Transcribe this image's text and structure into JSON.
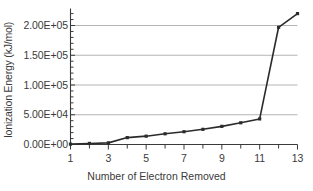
{
  "chart_data": {
    "type": "line",
    "title": "",
    "xlabel": "Number of Electron Removed",
    "ylabel": "Ionization Energy (kJ/mol)",
    "x": [
      1,
      2,
      3,
      4,
      5,
      6,
      7,
      8,
      9,
      10,
      11,
      12,
      13
    ],
    "values": [
      600,
      1800,
      2700,
      11600,
      14000,
      18000,
      21500,
      25500,
      30500,
      36500,
      43000,
      197000,
      220000
    ],
    "series": [
      {
        "name": "Ionization Energy",
        "values": [
          600,
          1800,
          2700,
          11600,
          14000,
          18000,
          21500,
          25500,
          30500,
          36500,
          43000,
          197000,
          220000
        ]
      }
    ],
    "xlim": [
      1,
      13
    ],
    "ylim": [
      0,
      230000
    ],
    "x_tick_labels": [
      "1",
      "3",
      "5",
      "7",
      "9",
      "11",
      "13"
    ],
    "x_tick_values": [
      1,
      3,
      5,
      7,
      9,
      11,
      13
    ],
    "x_minor_tick_values": [
      2,
      4,
      6,
      8,
      10,
      12
    ],
    "y_tick_labels": [
      "0.00E+00",
      "5.00E+04",
      "1.00E+05",
      "1.50E+05",
      "2.00E+05"
    ],
    "y_tick_values": [
      0,
      50000,
      100000,
      150000,
      200000
    ],
    "grid": "horizontal",
    "legend": "none",
    "marker": "square",
    "colors": {
      "line": "#2b2b2b",
      "marker": "#2b2b2b",
      "gridline": "#b5b5b5",
      "axis": "#3a3a3a",
      "text": "#3a3a3a",
      "background": "#ffffff"
    }
  }
}
